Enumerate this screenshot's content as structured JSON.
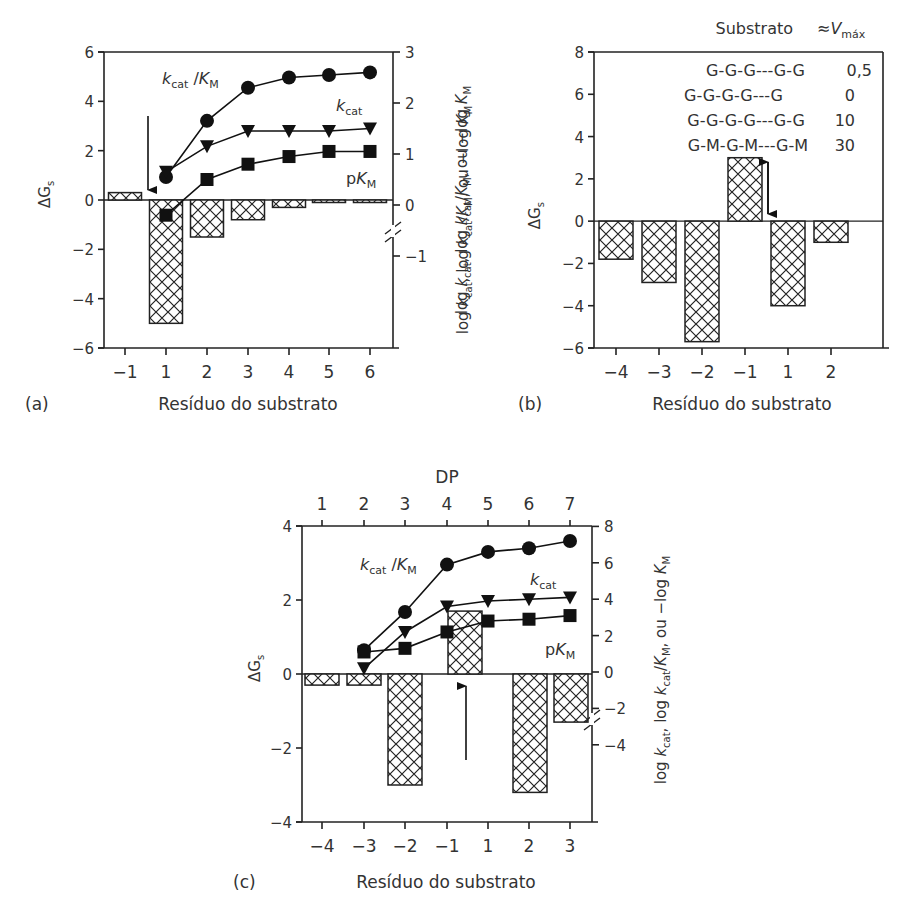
{
  "figure": {
    "panels": [
      {
        "id": "a",
        "label": "(a)",
        "xlabel": "Resíduo do substrato"
      },
      {
        "id": "b",
        "label": "(b)",
        "xlabel": "Resíduo do substrato"
      },
      {
        "id": "c",
        "label": "(c)",
        "xlabel": "Resíduo do substrato",
        "top_axis_label": "DP"
      }
    ],
    "ylabel_left": "ΔG",
    "ylabel_left_sub": "s",
    "ylabel_right": "log k_cat, log k_cat/K_M, ou −log K_M",
    "series_labels": {
      "kcat_km": "k_cat /K_M",
      "kcat": "k_cat",
      "pkm": "pK_M"
    },
    "legend_b": {
      "header_substrate": "Substrato",
      "header_vmax": "≈V_máx",
      "rows": [
        {
          "substrate": "G-G-G---G-G",
          "vmax": "0,5"
        },
        {
          "substrate": "G-G-G-G---G",
          "vmax": "0"
        },
        {
          "substrate": "G-G-G-G---G-G",
          "vmax": "10"
        },
        {
          "substrate": "G-M-G-M---G-M",
          "vmax": "30"
        }
      ]
    }
  },
  "chart_data": [
    {
      "panel": "a",
      "type": "bar",
      "title": "",
      "xlabel": "Resíduo do substrato",
      "ylabel": "ΔGs",
      "categories": [
        "-1",
        "1",
        "2",
        "3",
        "4",
        "5",
        "6"
      ],
      "ylim": [
        -6,
        6
      ],
      "yticks": [
        -6,
        -4,
        -2,
        0,
        2,
        4,
        6
      ],
      "series": [
        {
          "name": "ΔGs",
          "type": "bar",
          "values": [
            0.3,
            -5.0,
            -1.5,
            -0.8,
            -0.3,
            -0.05,
            -0.05
          ]
        }
      ],
      "secondary_axis": {
        "ylabel": "log kcat, log kcat/KM, ou −log KM",
        "ylim": [
          -1,
          3
        ],
        "yticks": [
          -1,
          0,
          1,
          2,
          3
        ],
        "broken": true,
        "x": [
          "1",
          "2",
          "3",
          "4",
          "5",
          "6"
        ],
        "series": [
          {
            "name": "kcat/KM",
            "marker": "circle",
            "values": [
              0.55,
              1.65,
              2.3,
              2.5,
              2.55,
              2.6
            ]
          },
          {
            "name": "kcat",
            "marker": "triangle-down",
            "values": [
              0.65,
              1.15,
              1.45,
              1.45,
              1.45,
              1.5
            ]
          },
          {
            "name": "pKM",
            "marker": "square",
            "values": [
              -0.2,
              0.5,
              0.8,
              0.95,
              1.05,
              1.05
            ]
          }
        ]
      },
      "annotations": [
        "down arrow between residues -1 and 1 (cleavage site)"
      ]
    },
    {
      "panel": "b",
      "type": "bar",
      "title": "",
      "xlabel": "Resíduo do substrato",
      "ylabel": "ΔGs",
      "categories": [
        "-4",
        "-3",
        "-2",
        "-1",
        "1",
        "2"
      ],
      "ylim": [
        -6,
        8
      ],
      "yticks": [
        -6,
        -4,
        -2,
        0,
        2,
        4,
        6,
        8
      ],
      "series": [
        {
          "name": "ΔGs",
          "type": "bar",
          "values": [
            -1.8,
            -2.9,
            -5.7,
            3.0,
            -4.0,
            -1.0
          ]
        }
      ],
      "annotations": [
        "double-headed arrow beside residue -1 bar (0 to 3)"
      ],
      "legend": {
        "position": "top-right",
        "entries": [
          "G-G-G---G-G 0,5",
          "G-G-G-G---G 0",
          "G-G-G-G---G-G 10",
          "G-M-G-M---G-M 30"
        ]
      }
    },
    {
      "panel": "c",
      "type": "bar",
      "title": "",
      "xlabel": "Resíduo do substrato",
      "ylabel": "ΔGs",
      "categories": [
        "-4",
        "-3",
        "-2",
        "-1",
        "1",
        "2",
        "3"
      ],
      "ylim": [
        -4,
        4
      ],
      "yticks": [
        -4,
        -2,
        0,
        2,
        4
      ],
      "series": [
        {
          "name": "ΔGs",
          "type": "bar",
          "values": [
            -0.3,
            -0.3,
            -3.0,
            1.7,
            0,
            -3.2,
            -1.3
          ]
        }
      ],
      "top_axis": {
        "label": "DP",
        "ticks": [
          1,
          2,
          3,
          4,
          5,
          6,
          7
        ]
      },
      "secondary_axis": {
        "ylabel": "log kcat, log kcat/KM, ou −log KM",
        "ylim": [
          -4,
          8
        ],
        "yticks": [
          -4,
          -2,
          0,
          2,
          4,
          6,
          8
        ],
        "broken": true,
        "x_dp": [
          2,
          3,
          4,
          5,
          6,
          7
        ],
        "series": [
          {
            "name": "kcat/KM",
            "marker": "circle",
            "values": [
              1.2,
              3.3,
              5.9,
              6.6,
              6.8,
              7.2
            ]
          },
          {
            "name": "kcat",
            "marker": "triangle-down",
            "values": [
              0.2,
              2.2,
              3.6,
              3.9,
              4.0,
              4.1
            ]
          },
          {
            "name": "pKM",
            "marker": "square",
            "values": [
              1.1,
              1.3,
              2.2,
              2.8,
              2.9,
              3.1
            ]
          }
        ]
      },
      "annotations": [
        "up arrow below the -1/1 boundary (cleavage site)"
      ]
    }
  ]
}
